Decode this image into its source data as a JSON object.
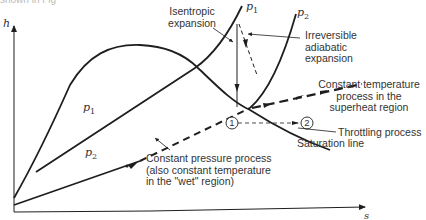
{
  "caption_fragment": "shown in Fig",
  "axes": {
    "y_label": "h",
    "x_label": "s"
  },
  "curve_labels": {
    "p1_top": "p",
    "p1_top_sub": "1",
    "p2_top": "p",
    "p2_top_sub": "2",
    "p1_inner": "p",
    "p1_inner_sub": "1",
    "p2_inner": "p",
    "p2_inner_sub": "2"
  },
  "annotations": {
    "isentropic": [
      "Isentropic",
      "expansion"
    ],
    "irreversible": [
      "Irreversible",
      "adiabatic",
      "expansion"
    ],
    "constant_temperature": [
      "Constant temperature",
      "process in the",
      "superheat region"
    ],
    "throttling": "Throttling process",
    "saturation": "Saturation line",
    "constant_pressure": [
      "Constant pressure process",
      "(also constant temperature",
      "in the \"wet\" region)"
    ]
  },
  "points": {
    "state1": "1",
    "state2": "2"
  },
  "colors": {
    "line": "#1e1e1e",
    "text": "#333333",
    "background": "#ffffff"
  }
}
